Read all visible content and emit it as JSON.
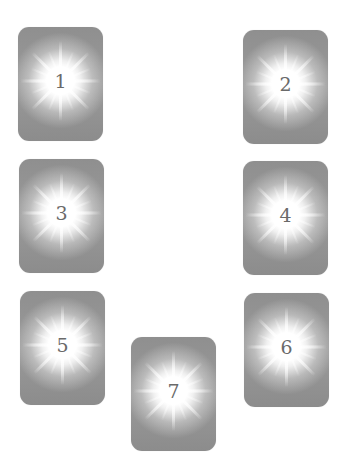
{
  "cards": [
    {
      "number": "1",
      "x": 18,
      "y": 27
    },
    {
      "number": "2",
      "x": 243,
      "y": 30
    },
    {
      "number": "3",
      "x": 19,
      "y": 159
    },
    {
      "number": "4",
      "x": 243,
      "y": 161
    },
    {
      "number": "5",
      "x": 20,
      "y": 291
    },
    {
      "number": "6",
      "x": 244,
      "y": 293
    },
    {
      "number": "7",
      "x": 131,
      "y": 337
    }
  ],
  "colors": {
    "card_gray": "#8f8f8f",
    "glow": "#ffffff",
    "number": "#6a6a6a",
    "background": "#ffffff"
  }
}
